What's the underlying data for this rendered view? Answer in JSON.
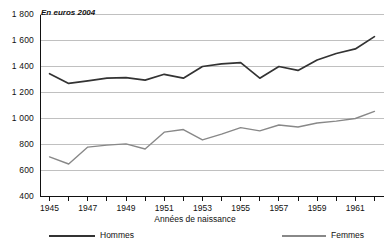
{
  "chart_data": {
    "type": "line",
    "title": "",
    "subtitle": "",
    "unit_note": "En euros 2004",
    "xlabel": "Années de naissance",
    "ylabel": "",
    "xlim": [
      1944.5,
      1962.5
    ],
    "ylim": [
      400,
      1800
    ],
    "ytick_step": 200,
    "grid": true,
    "legend_position": "bottom",
    "x": [
      1945,
      1946,
      1947,
      1948,
      1949,
      1950,
      1951,
      1952,
      1953,
      1954,
      1955,
      1956,
      1957,
      1958,
      1959,
      1960,
      1961,
      1962
    ],
    "categories": [
      "1945",
      "1946",
      "1947",
      "1948",
      "1949",
      "1950",
      "1951",
      "1952",
      "1953",
      "1954",
      "1955",
      "1956",
      "1957",
      "1958",
      "1959",
      "1960",
      "1961",
      "1962"
    ],
    "xticks": [
      "1945",
      "1947",
      "1949",
      "1951",
      "1953",
      "1955",
      "1957",
      "1959",
      "1961"
    ],
    "yticks": [
      "400",
      "600",
      "800",
      "1 000",
      "1 200",
      "1 400",
      "1 600",
      "1 800"
    ],
    "series": [
      {
        "name": "Hommes",
        "color": "#333333",
        "values": [
          1345,
          1270,
          1290,
          1310,
          1315,
          1295,
          1340,
          1310,
          1400,
          1420,
          1430,
          1310,
          1400,
          1370,
          1450,
          1500,
          1535,
          1630
        ]
      },
      {
        "name": "Femmes",
        "color": "#888888",
        "values": [
          705,
          650,
          780,
          795,
          805,
          765,
          895,
          915,
          835,
          880,
          930,
          905,
          950,
          935,
          965,
          980,
          1000,
          1055
        ]
      }
    ]
  },
  "legend": {
    "items": [
      {
        "label": "Hommes"
      },
      {
        "label": "Femmes"
      }
    ]
  },
  "axis": {
    "x_title": "Années de naissance"
  },
  "colors": {
    "hommes": "#333333",
    "femmes": "#888888",
    "grid": "#b9b9b9",
    "axis": "#111111",
    "background": "#ffffff"
  }
}
